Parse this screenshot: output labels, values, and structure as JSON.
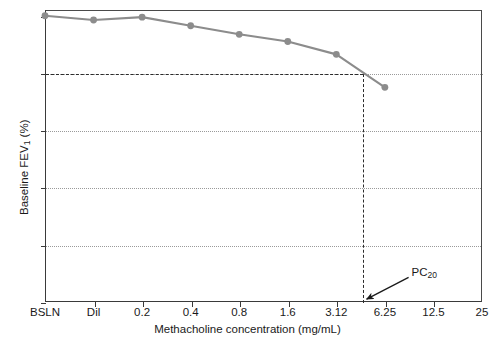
{
  "chart_data": {
    "type": "line",
    "title": "",
    "xlabel": "Methacholine concentration (mg/mL)",
    "ylabel": "Baseline FEV1 (%)",
    "ylabel_main": "Baseline FEV",
    "ylabel_sub": "1",
    "ylabel_unit": " (%)",
    "categories": [
      "BSLN",
      "Dil",
      "0.2",
      "0.4",
      "0.8",
      "1.6",
      "3.12",
      "6.25",
      "12.5",
      "25"
    ],
    "x_tick_labels": [
      "BSLN",
      "Dil",
      "0.2",
      "0.4",
      "0.8",
      "1.6",
      "3.12",
      "6.25",
      "12.5",
      "25"
    ],
    "y_tick_labels": [
      "0",
      "20",
      "40",
      "60",
      "80",
      "100"
    ],
    "y_ticks": [
      0,
      20,
      40,
      60,
      80,
      100
    ],
    "ylim": [
      0,
      102
    ],
    "grid": "horizontal-dotted",
    "legend": "none",
    "series": [
      {
        "name": "Baseline FEV1 (%)",
        "color": "#8c8c8c",
        "marker": "circle",
        "points": [
          {
            "x_label": "BSLN",
            "x_index": 0,
            "y": 100.0
          },
          {
            "x_label": "Dil",
            "x_index": 1,
            "y": 98.5
          },
          {
            "x_label": "0.2",
            "x_index": 2,
            "y": 99.5
          },
          {
            "x_label": "0.4",
            "x_index": 3,
            "y": 96.5
          },
          {
            "x_label": "0.8",
            "x_index": 4,
            "y": 93.5
          },
          {
            "x_label": "1.6",
            "x_index": 5,
            "y": 91.0
          },
          {
            "x_label": "3.12",
            "x_index": 6,
            "y": 86.5
          },
          {
            "x_label": "6.25",
            "x_index": 7,
            "y": 75.0
          }
        ]
      }
    ],
    "annotations": [
      {
        "name": "pc20-label",
        "text": "PC20",
        "text_main": "PC",
        "text_sub": "20",
        "x_index": 7.55,
        "y": 10,
        "arrow_to_x_index": 6.52,
        "arrow_to_y": 1
      }
    ],
    "reference_lines": [
      {
        "name": "pc20-threshold",
        "orientation": "horizontal",
        "value": 80,
        "style": "dashed",
        "color": "#2b2b2b"
      },
      {
        "name": "pc20-concentration",
        "orientation": "vertical",
        "value_x_index": 6.52,
        "from_y": 0,
        "to_y": 80,
        "style": "dashed",
        "color": "#2b2b2b"
      }
    ],
    "gridlines_y": [
      20,
      40,
      60,
      80
    ]
  },
  "colors": {
    "series": "#8c8c8c",
    "axis": "#3a3a3a",
    "grid": "#9a9a9a",
    "reference": "#2b2b2b",
    "background": "#ffffff"
  }
}
